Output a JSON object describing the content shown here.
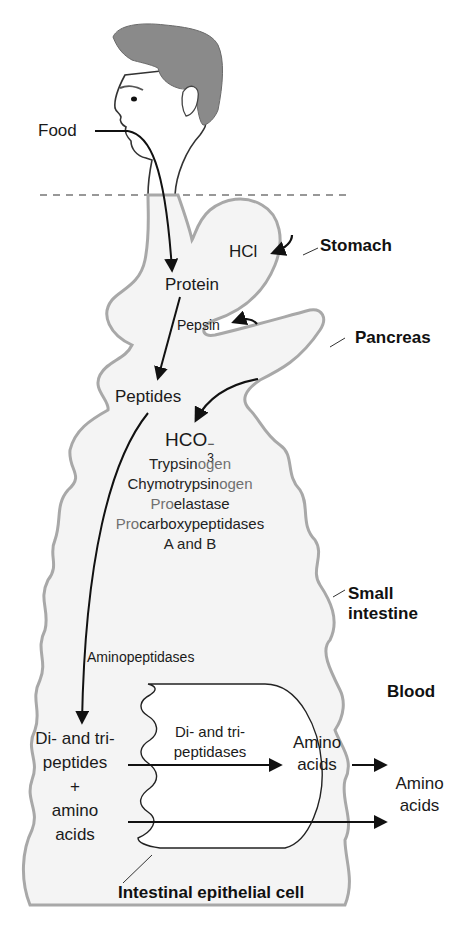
{
  "figure": {
    "colors": {
      "background": "#ffffff",
      "organ_fill": "#f4f4f4",
      "organ_outline": "#a8a8a8",
      "hair": "#8a8a8a",
      "arrow": "#111111",
      "text": "#1a1a1a",
      "muted_text": "#707070"
    }
  },
  "labels": {
    "food": "Food",
    "hcl": "HCl",
    "stomach": "Stomach",
    "protein": "Protein",
    "pepsin": "Pepsin",
    "pancreas": "Pancreas",
    "peptides": "Peptides",
    "bicarbonate": {
      "base": "HCO",
      "sup": "−",
      "sub": "3"
    },
    "pancreatic_enzymes": [
      {
        "dark": "Trypsin",
        "muted": "ogen",
        "prefix_muted": ""
      },
      {
        "dark": "Chymotrypsin",
        "muted": "ogen",
        "prefix_muted": ""
      },
      {
        "prefix_muted": "Pro",
        "dark": "elastase",
        "muted": ""
      },
      {
        "prefix_muted": "Pro",
        "dark": "carboxypeptidases",
        "muted": ""
      },
      {
        "prefix_muted": "",
        "dark": "A and B",
        "muted": ""
      }
    ],
    "small_intestine_line1": "Small",
    "small_intestine_line2": "intestine",
    "aminopeptidases": "Aminopeptidases",
    "blood": "Blood",
    "di_tri_peptides_line1": "Di- and tri-",
    "di_tri_peptides_line2": "peptides",
    "plus": "+",
    "amino_acids_left_line1": "amino",
    "amino_acids_left_line2": "acids",
    "di_tri_peptidases_line1": "Di- and tri-",
    "di_tri_peptidases_line2": "peptidases",
    "amino_acids_cell_line1": "Amino",
    "amino_acids_cell_line2": "acids",
    "amino_acids_blood_line1": "Amino",
    "amino_acids_blood_line2": "acids",
    "intestinal_epithelial_cell": "Intestinal epithelial cell"
  },
  "icons": {
    "head": "human-head-profile",
    "arrows": "flow-arrow"
  }
}
